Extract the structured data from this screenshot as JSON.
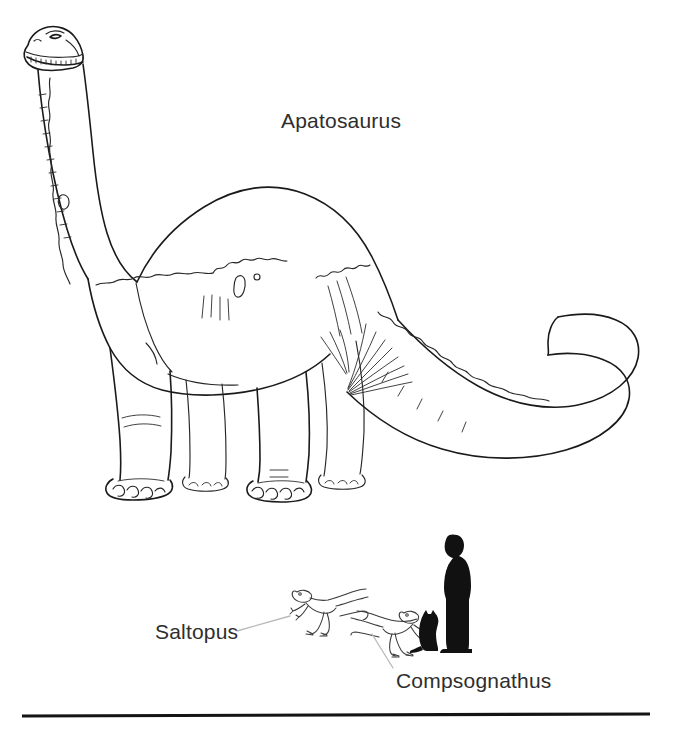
{
  "figure": {
    "title_visible": false,
    "background_color": "#ffffff",
    "ink_color": "#1a1a1a",
    "label_color": "#2e2e2e",
    "leader_line_color": "#b9b9b9",
    "width": 673,
    "height": 735
  },
  "labels": {
    "apatosaurus": "Apatosaurus",
    "saltopus": "Saltopus",
    "compsognathus": "Compsognathus"
  },
  "subjects": [
    {
      "name": "apatosaurus",
      "label": "Apatosaurus",
      "style": "line-drawing-outline",
      "pose": "standing, head raised left, long tail curling right",
      "bounds": {
        "x": 18,
        "y": 22,
        "width": 640,
        "height": 490
      }
    },
    {
      "name": "saltopus",
      "label": "Saltopus",
      "style": "line-drawing-outline",
      "pose": "bipedal, facing left, tail extended right",
      "bounds": {
        "x": 288,
        "y": 583,
        "width": 78,
        "height": 52
      }
    },
    {
      "name": "compsognathus",
      "label": "Compsognathus",
      "style": "line-drawing-outline",
      "pose": "bipedal, facing left, tail extended right",
      "bounds": {
        "x": 352,
        "y": 606,
        "width": 74,
        "height": 48
      }
    },
    {
      "name": "human-silhouette",
      "label": "",
      "style": "solid-silhouette",
      "pose": "standing, facing left",
      "bounds": {
        "x": 435,
        "y": 534,
        "width": 38,
        "height": 117
      }
    },
    {
      "name": "cat-silhouette",
      "label": "",
      "style": "solid-silhouette",
      "pose": "sitting, facing right",
      "bounds": {
        "x": 410,
        "y": 611,
        "width": 36,
        "height": 40
      }
    }
  ],
  "leader_lines": [
    {
      "name": "saltopus-leader",
      "from_label": "Saltopus",
      "to_subject": "saltopus"
    },
    {
      "name": "compsognathus-leader",
      "from_label": "Compsognathus",
      "to_subject": "compsognathus"
    }
  ],
  "baseline": {
    "name": "ground-rule",
    "x1": 22,
    "x2": 650,
    "y": 716,
    "thickness": 3.2,
    "color": "#141414"
  }
}
